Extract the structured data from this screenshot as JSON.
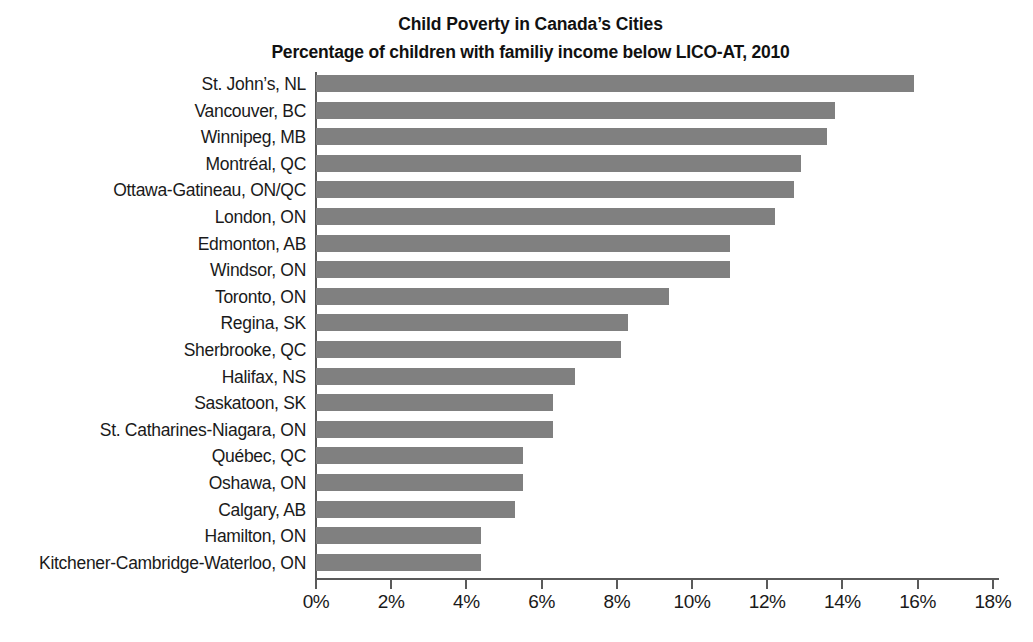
{
  "chart_data": {
    "type": "bar",
    "orientation": "horizontal",
    "title": "Child Poverty in Canada’s Cities",
    "subtitle": "Percentage of children with familiy income below LICO-AT, 2010",
    "xlabel": "",
    "ylabel": "",
    "xlim": [
      0,
      18
    ],
    "xticks": [
      "0%",
      "2%",
      "4%",
      "6%",
      "8%",
      "10%",
      "12%",
      "14%",
      "16%",
      "18%"
    ],
    "xtick_values": [
      0,
      2,
      4,
      6,
      8,
      10,
      12,
      14,
      16,
      18
    ],
    "grid": false,
    "legend": "none",
    "bar_color": "#808080",
    "axis_color": "#5a5a5a",
    "categories": [
      "St. John’s, NL",
      "Vancouver, BC",
      "Winnipeg, MB",
      "Montréal, QC",
      "Ottawa-Gatineau, ON/QC",
      "London, ON",
      "Edmonton, AB",
      "Windsor, ON",
      "Toronto, ON",
      "Regina, SK",
      "Sherbrooke, QC",
      "Halifax, NS",
      "Saskatoon, SK",
      "St. Catharines-Niagara, ON",
      "Québec, QC",
      "Oshawa, ON",
      "Calgary, AB",
      "Hamilton, ON",
      "Kitchener-Cambridge-Waterloo, ON"
    ],
    "values": [
      15.9,
      13.8,
      13.6,
      12.9,
      12.7,
      12.2,
      11.0,
      11.0,
      9.4,
      8.3,
      8.1,
      6.9,
      6.3,
      6.3,
      5.5,
      5.5,
      5.3,
      4.4,
      4.4
    ],
    "value_labels": [
      "15.9%",
      "13.8%",
      "13.6%",
      "12.9%",
      "12.7%",
      "12.2%",
      "11.0%",
      "11.0%",
      "9.4%",
      "8.3%",
      "8.1%",
      "6.9%",
      "6.3%",
      "6.3%",
      "5.5%",
      "5.5%",
      "5.3%",
      "4.4%",
      "4.4%"
    ]
  }
}
